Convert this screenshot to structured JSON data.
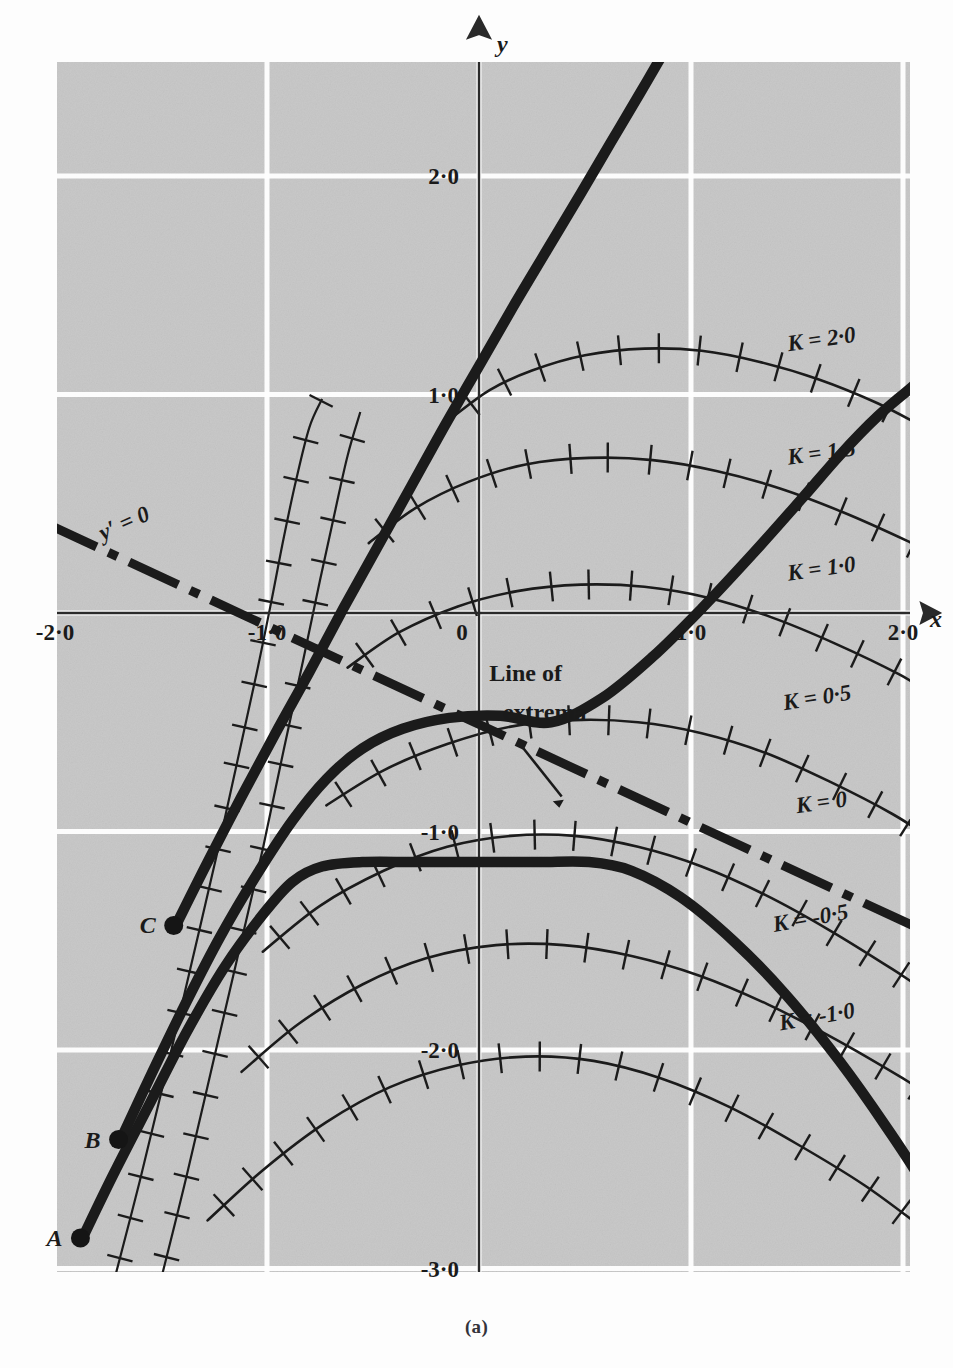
{
  "figure": {
    "caption": "(a)",
    "panel": {
      "bg_color": "#c9c9c9",
      "grid_color": "#ffffff",
      "ink_color": "#1b1b1b",
      "left_px": 57,
      "top_px": 62,
      "right_px": 910,
      "bottom_px": 1272
    },
    "axes": {
      "x_label": "x",
      "y_label": "y",
      "x_axis_y_px": 613,
      "y_axis_x_px": 479,
      "px_per_unit_x": 212,
      "px_per_unit_y": 218.5,
      "xlim": [
        -2.5,
        2.3
      ],
      "ylim": [
        -3.1,
        2.6
      ],
      "x_ticks": [
        {
          "label": "-2·0",
          "value": -2.0
        },
        {
          "label": "-1·0",
          "value": -1.0
        },
        {
          "label": "0",
          "value": 0.0
        },
        {
          "label": "1·0",
          "value": 1.0
        },
        {
          "label": "2·0",
          "value": 2.0
        }
      ],
      "y_ticks": [
        {
          "label": "2·0",
          "value": 2.0
        },
        {
          "label": "1·0",
          "value": 1.0
        },
        {
          "label": "-1·0",
          "value": -1.0
        },
        {
          "label": "-2·0",
          "value": -2.0
        },
        {
          "label": "-3·0",
          "value": -3.0
        }
      ],
      "grid_x_values": [
        -1.0,
        0.0,
        1.0,
        2.0
      ],
      "grid_y_values": [
        2.0,
        1.0,
        0.0,
        -1.0,
        -2.0,
        -3.0
      ]
    },
    "annotations": {
      "extrema_label_line1": "Line of",
      "extrema_label_line2": "extrema",
      "yprime_label": "y′ = 0"
    },
    "points": [
      {
        "name": "A",
        "label": "A",
        "x": -1.88,
        "y": -2.86
      },
      {
        "name": "B",
        "label": "B",
        "x": -1.7,
        "y": -2.41
      },
      {
        "name": "C",
        "label": "C",
        "x": -1.44,
        "y": -1.43
      }
    ]
  },
  "chart_data": {
    "type": "line",
    "title": "",
    "xlabel": "x",
    "ylabel": "y",
    "xlim": [
      -2.5,
      2.3
    ],
    "ylim": [
      -3.1,
      2.6
    ],
    "grid": true,
    "legend": "inline-curve-labels",
    "isocline_labels": [
      "K = 2·0",
      "K = 1·5",
      "K = 1·0",
      "K = 0·5",
      "K = 0",
      "K = -0·5",
      "K = -1·0"
    ],
    "series": [
      {
        "name": "K = 2·0",
        "kind": "isocline",
        "hatched": true,
        "label": "K = 2·0",
        "label_x": 1.62,
        "label_y": 1.22,
        "points": [
          [
            -0.12,
            0.9
          ],
          [
            0.05,
            1.02
          ],
          [
            0.25,
            1.11
          ],
          [
            0.5,
            1.18
          ],
          [
            0.78,
            1.21
          ],
          [
            1.05,
            1.2
          ],
          [
            1.32,
            1.15
          ],
          [
            1.6,
            1.07
          ],
          [
            1.88,
            0.96
          ],
          [
            2.1,
            0.85
          ]
        ]
      },
      {
        "name": "K = 1·5",
        "kind": "isocline",
        "hatched": true,
        "label": "K = 1·5",
        "label_x": 1.62,
        "label_y": 0.7,
        "points": [
          [
            -0.52,
            0.32
          ],
          [
            -0.3,
            0.48
          ],
          [
            -0.05,
            0.6
          ],
          [
            0.22,
            0.68
          ],
          [
            0.52,
            0.71
          ],
          [
            0.82,
            0.7
          ],
          [
            1.12,
            0.65
          ],
          [
            1.42,
            0.57
          ],
          [
            1.72,
            0.46
          ],
          [
            2.02,
            0.33
          ],
          [
            2.12,
            0.28
          ]
        ]
      },
      {
        "name": "K = 1·0",
        "kind": "isocline",
        "hatched": true,
        "label": "K = 1·0",
        "label_x": 1.62,
        "label_y": 0.17,
        "points": [
          [
            -0.62,
            -0.25
          ],
          [
            -0.38,
            -0.09
          ],
          [
            -0.1,
            0.03
          ],
          [
            0.18,
            0.1
          ],
          [
            0.48,
            0.13
          ],
          [
            0.78,
            0.12
          ],
          [
            1.08,
            0.07
          ],
          [
            1.38,
            -0.02
          ],
          [
            1.68,
            -0.14
          ],
          [
            1.98,
            -0.28
          ],
          [
            2.15,
            -0.38
          ]
        ]
      },
      {
        "name": "K = 0·5",
        "kind": "isocline",
        "hatched": true,
        "label": "K = 0·5",
        "label_x": 1.6,
        "label_y": -0.42,
        "points": [
          [
            -0.72,
            -0.88
          ],
          [
            -0.45,
            -0.72
          ],
          [
            -0.15,
            -0.6
          ],
          [
            0.15,
            -0.52
          ],
          [
            0.45,
            -0.49
          ],
          [
            0.75,
            -0.5
          ],
          [
            1.05,
            -0.55
          ],
          [
            1.35,
            -0.64
          ],
          [
            1.65,
            -0.77
          ],
          [
            1.95,
            -0.92
          ],
          [
            2.16,
            -1.05
          ]
        ]
      },
      {
        "name": "K = 0",
        "kind": "isocline",
        "hatched": true,
        "label": "K = 0",
        "label_x": 1.62,
        "label_y": -0.9,
        "points": [
          [
            -1.02,
            -1.55
          ],
          [
            -0.75,
            -1.34
          ],
          [
            -0.45,
            -1.18
          ],
          [
            -0.15,
            -1.07
          ],
          [
            0.15,
            -1.02
          ],
          [
            0.45,
            -1.02
          ],
          [
            0.75,
            -1.07
          ],
          [
            1.05,
            -1.16
          ],
          [
            1.35,
            -1.29
          ],
          [
            1.65,
            -1.45
          ],
          [
            1.95,
            -1.63
          ],
          [
            2.15,
            -1.76
          ]
        ]
      },
      {
        "name": "K = -0·5",
        "kind": "isocline",
        "hatched": true,
        "label": "K = -0·5",
        "label_x": 1.57,
        "label_y": -1.43,
        "points": [
          [
            -1.12,
            -2.1
          ],
          [
            -0.85,
            -1.88
          ],
          [
            -0.55,
            -1.7
          ],
          [
            -0.25,
            -1.58
          ],
          [
            0.08,
            -1.52
          ],
          [
            0.4,
            -1.52
          ],
          [
            0.72,
            -1.57
          ],
          [
            1.04,
            -1.66
          ],
          [
            1.36,
            -1.79
          ],
          [
            1.68,
            -1.95
          ],
          [
            2.0,
            -2.13
          ],
          [
            2.16,
            -2.23
          ]
        ]
      },
      {
        "name": "K = -1·0",
        "kind": "isocline",
        "hatched": true,
        "label": "K = -1·0",
        "label_x": 1.6,
        "label_y": -1.88,
        "points": [
          [
            -1.28,
            -2.78
          ],
          [
            -1.02,
            -2.55
          ],
          [
            -0.72,
            -2.33
          ],
          [
            -0.42,
            -2.17
          ],
          [
            -0.1,
            -2.07
          ],
          [
            0.22,
            -2.03
          ],
          [
            0.54,
            -2.05
          ],
          [
            0.86,
            -2.13
          ],
          [
            1.18,
            -2.26
          ],
          [
            1.5,
            -2.43
          ],
          [
            1.82,
            -2.62
          ],
          [
            2.1,
            -2.82
          ]
        ]
      },
      {
        "name": "trajectory-A",
        "kind": "trajectory",
        "bold": true,
        "start_point": "A",
        "points": [
          [
            -1.86,
            -2.84
          ],
          [
            -1.72,
            -2.56
          ],
          [
            -1.55,
            -2.24
          ],
          [
            -1.38,
            -1.92
          ],
          [
            -1.2,
            -1.62
          ],
          [
            -1.02,
            -1.38
          ],
          [
            -0.88,
            -1.23
          ],
          [
            -0.74,
            -1.16
          ],
          [
            -0.55,
            -1.14
          ],
          [
            -0.3,
            -1.14
          ],
          [
            -0.02,
            -1.14
          ],
          [
            0.28,
            -1.14
          ],
          [
            0.52,
            -1.14
          ],
          [
            0.72,
            -1.18
          ],
          [
            0.95,
            -1.3
          ],
          [
            1.2,
            -1.5
          ],
          [
            1.45,
            -1.75
          ],
          [
            1.7,
            -2.05
          ],
          [
            1.92,
            -2.35
          ],
          [
            2.1,
            -2.62
          ],
          [
            2.2,
            -2.82
          ]
        ]
      },
      {
        "name": "trajectory-B",
        "kind": "trajectory",
        "bold": true,
        "start_point": "B",
        "points": [
          [
            -1.68,
            -2.39
          ],
          [
            -1.54,
            -2.1
          ],
          [
            -1.38,
            -1.78
          ],
          [
            -1.22,
            -1.48
          ],
          [
            -1.05,
            -1.2
          ],
          [
            -0.88,
            -0.95
          ],
          [
            -0.72,
            -0.76
          ],
          [
            -0.55,
            -0.62
          ],
          [
            -0.36,
            -0.53
          ],
          [
            -0.14,
            -0.48
          ],
          [
            0.1,
            -0.47
          ],
          [
            0.34,
            -0.5
          ],
          [
            0.58,
            -0.39
          ],
          [
            0.82,
            -0.2
          ],
          [
            1.05,
            0.02
          ],
          [
            1.3,
            0.28
          ],
          [
            1.52,
            0.52
          ],
          [
            1.7,
            0.72
          ],
          [
            1.88,
            0.9
          ],
          [
            2.06,
            1.05
          ],
          [
            2.2,
            1.18
          ]
        ]
      },
      {
        "name": "trajectory-C",
        "kind": "trajectory",
        "bold": true,
        "start_point": "C",
        "points": [
          [
            -1.42,
            -1.41
          ],
          [
            -1.28,
            -1.14
          ],
          [
            -1.12,
            -0.84
          ],
          [
            -0.96,
            -0.55
          ],
          [
            -0.8,
            -0.27
          ],
          [
            -0.64,
            0.02
          ],
          [
            -0.48,
            0.3
          ],
          [
            -0.32,
            0.58
          ],
          [
            -0.16,
            0.86
          ],
          [
            0.0,
            1.13
          ],
          [
            0.16,
            1.4
          ],
          [
            0.32,
            1.66
          ],
          [
            0.48,
            1.92
          ],
          [
            0.62,
            2.15
          ],
          [
            0.76,
            2.38
          ],
          [
            0.88,
            2.58
          ]
        ]
      },
      {
        "name": "thin-curve-left-1",
        "kind": "thin-curve",
        "points": [
          [
            -1.72,
            -3.05
          ],
          [
            -1.6,
            -2.6
          ],
          [
            -1.48,
            -2.12
          ],
          [
            -1.36,
            -1.62
          ],
          [
            -1.24,
            -1.12
          ],
          [
            -1.14,
            -0.68
          ],
          [
            -1.05,
            -0.28
          ],
          [
            -0.98,
            0.05
          ],
          [
            -0.92,
            0.35
          ],
          [
            -0.86,
            0.62
          ],
          [
            -0.8,
            0.85
          ],
          [
            -0.74,
            0.98
          ]
        ]
      },
      {
        "name": "thin-curve-left-2",
        "kind": "thin-curve",
        "points": [
          [
            -1.5,
            -3.05
          ],
          [
            -1.38,
            -2.58
          ],
          [
            -1.26,
            -2.08
          ],
          [
            -1.14,
            -1.58
          ],
          [
            -1.02,
            -1.08
          ],
          [
            -0.92,
            -0.62
          ],
          [
            -0.83,
            -0.22
          ],
          [
            -0.75,
            0.15
          ],
          [
            -0.68,
            0.46
          ],
          [
            -0.62,
            0.72
          ],
          [
            -0.56,
            0.92
          ]
        ]
      },
      {
        "name": "line-of-extrema",
        "kind": "dash-dot",
        "label": "Line of extrema",
        "points": [
          [
            -2.42,
            0.58
          ],
          [
            2.2,
            -1.5
          ]
        ]
      }
    ],
    "annotations": [
      {
        "text": "y′ = 0",
        "x": -1.72,
        "y": 0.35
      },
      {
        "text": "Line of",
        "x": 0.22,
        "y": -0.33
      },
      {
        "text": "extrema",
        "x": 0.28,
        "y": -0.5
      },
      {
        "text": "(a)",
        "x": 0.0,
        "y": -3.45
      }
    ]
  }
}
